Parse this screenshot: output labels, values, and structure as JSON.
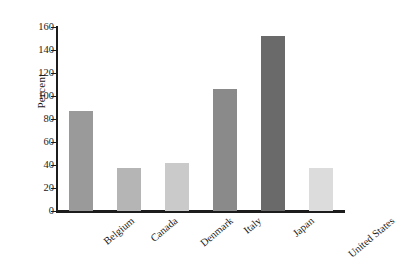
{
  "chart_data": {
    "type": "bar",
    "title": "",
    "xlabel": "",
    "ylabel": "Percent",
    "ylim": [
      0,
      160
    ],
    "yticks": [
      0,
      20,
      40,
      60,
      80,
      100,
      120,
      140,
      160
    ],
    "grid": false,
    "legend": "none",
    "categories": [
      "Belgium",
      "Canada",
      "Denmark",
      "Italy",
      "Japan",
      "United States"
    ],
    "values": [
      87,
      37,
      42,
      106,
      152,
      37
    ],
    "bar_colors": [
      "#9a9a9a",
      "#b5b5b5",
      "#cacaca",
      "#8a8a8a",
      "#6a6a6a",
      "#dcdcdc"
    ],
    "axis_color": "#1c1c1c",
    "background_color": "#ffffff"
  }
}
